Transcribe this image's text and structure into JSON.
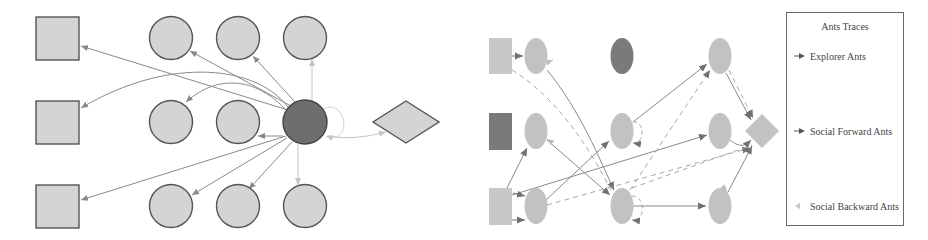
{
  "colors": {
    "node_fill": "#d4d4d4",
    "node_stroke": "#555555",
    "dark_node": "#6e6e6e",
    "edge": "#8a8a8a",
    "edge_light": "#c4c4c4",
    "dashed_edge": "#a8a8a8",
    "right_node_fill": "#c2c2c2",
    "right_dark_fill": "#7a7a7a"
  },
  "left_diagram": {
    "squares": [
      {
        "id": "sq1",
        "cx": 57,
        "cy": 38
      },
      {
        "id": "sq2",
        "cx": 57,
        "cy": 122
      },
      {
        "id": "sq3",
        "cx": 57,
        "cy": 206
      }
    ],
    "circles": [
      {
        "id": "c11",
        "cx": 171,
        "cy": 38
      },
      {
        "id": "c12",
        "cx": 238,
        "cy": 38
      },
      {
        "id": "c13",
        "cx": 305,
        "cy": 38
      },
      {
        "id": "c21",
        "cx": 171,
        "cy": 122
      },
      {
        "id": "c22",
        "cx": 238,
        "cy": 122
      },
      {
        "id": "c23",
        "cx": 305,
        "cy": 122,
        "dark": true
      },
      {
        "id": "c31",
        "cx": 171,
        "cy": 206
      },
      {
        "id": "c32",
        "cx": 238,
        "cy": 206
      },
      {
        "id": "c33",
        "cx": 305,
        "cy": 206
      }
    ],
    "diamond": {
      "id": "dest",
      "cx": 406,
      "cy": 122
    }
  },
  "right_diagram": {
    "squares": [
      {
        "id": "rsq1",
        "cx": 500,
        "cy": 56,
        "dark": false
      },
      {
        "id": "rsq2",
        "cx": 500,
        "cy": 131,
        "dark": true
      },
      {
        "id": "rsq3",
        "cx": 500,
        "cy": 206,
        "dark": false
      }
    ],
    "ellipses": [
      {
        "id": "e11",
        "cx": 536,
        "cy": 56
      },
      {
        "id": "e12",
        "cx": 622,
        "cy": 56,
        "dark": true
      },
      {
        "id": "e13",
        "cx": 720,
        "cy": 56
      },
      {
        "id": "e21",
        "cx": 536,
        "cy": 131
      },
      {
        "id": "e22",
        "cx": 622,
        "cy": 131
      },
      {
        "id": "e23",
        "cx": 720,
        "cy": 131
      },
      {
        "id": "e31",
        "cx": 536,
        "cy": 206
      },
      {
        "id": "e32",
        "cx": 622,
        "cy": 206
      },
      {
        "id": "e33",
        "cx": 720,
        "cy": 206
      }
    ],
    "diamond": {
      "id": "rdest",
      "cx": 762,
      "cy": 131
    }
  },
  "legend": {
    "title": "Ants Traces",
    "items": [
      {
        "label": "Explorer Ants",
        "marker": "arrow-dark"
      },
      {
        "label": "Social Forward Ants",
        "marker": "arrow-dark"
      },
      {
        "label": "Social Backward Ants",
        "marker": "arrow-light"
      }
    ]
  }
}
